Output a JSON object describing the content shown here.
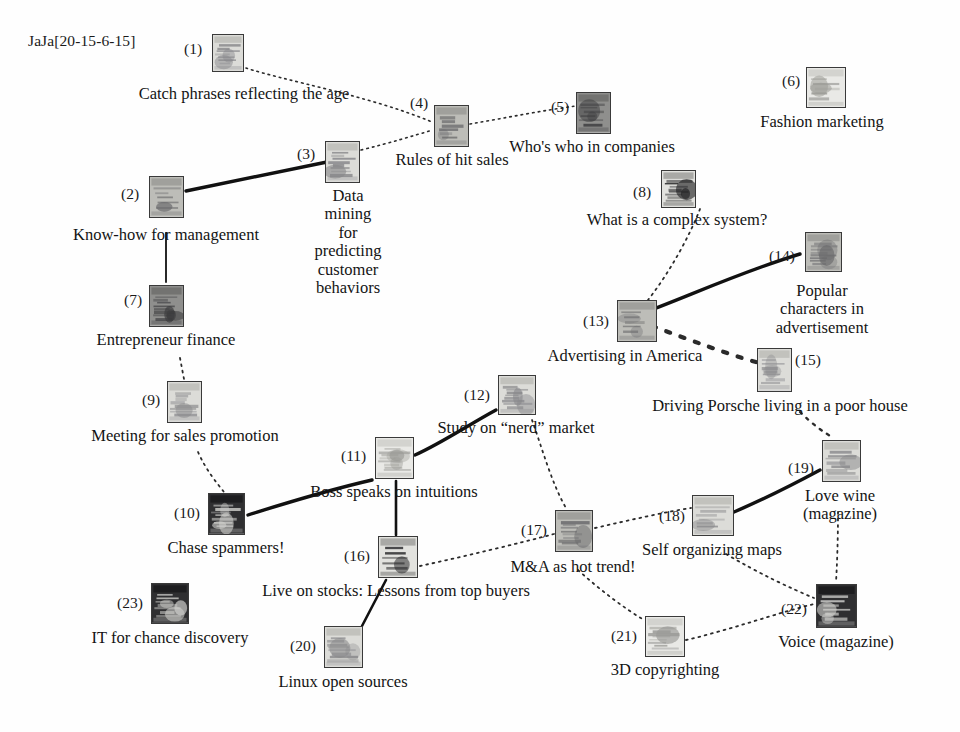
{
  "header": {
    "label": "JaJa[20-15-6-15]"
  },
  "colors": {
    "background": "#fefefe",
    "text": "#141414",
    "edge_solid": "#111111",
    "edge_dashed": "#2b2b2b",
    "thumb_border": "#3a3a3a"
  },
  "nodes": [
    {
      "id": 1,
      "index": "(1)",
      "caption": "Catch phrases reflecting the age",
      "thumb": {
        "x": 212,
        "y": 34,
        "w": 32,
        "h": 38,
        "tone": "light",
        "pattern": "photo-a"
      },
      "index_x": 184,
      "index_y": 41,
      "caption_x": 244,
      "caption_y": 85,
      "caption_w": 0,
      "caption_align": "center"
    },
    {
      "id": 2,
      "index": "(2)",
      "caption": "Know-how for management",
      "thumb": {
        "x": 149,
        "y": 176,
        "w": 35,
        "h": 42,
        "tone": "mid",
        "pattern": "photo-b"
      },
      "index_x": 121,
      "index_y": 186,
      "caption_x": 166,
      "caption_y": 226,
      "caption_w": 0,
      "caption_align": "center"
    },
    {
      "id": 3,
      "index": "(3)",
      "caption": "Data mining for predicting\ncustomer behaviors",
      "thumb": {
        "x": 325,
        "y": 141,
        "w": 35,
        "h": 42,
        "tone": "light",
        "pattern": "photo-c"
      },
      "index_x": 297,
      "index_y": 146,
      "caption_x": 348,
      "caption_y": 187,
      "caption_w": 0,
      "caption_align": "center"
    },
    {
      "id": 4,
      "index": "(4)",
      "caption": "Rules of hit sales",
      "thumb": {
        "x": 434,
        "y": 105,
        "w": 35,
        "h": 42,
        "tone": "mid",
        "pattern": "photo-d"
      },
      "index_x": 410,
      "index_y": 95,
      "caption_x": 452,
      "caption_y": 151,
      "caption_w": 0,
      "caption_align": "center"
    },
    {
      "id": 5,
      "index": "(5)",
      "caption": "Who's who in companies",
      "thumb": {
        "x": 576,
        "y": 92,
        "w": 35,
        "h": 42,
        "tone": "dark",
        "pattern": "photo-e"
      },
      "index_x": 551,
      "index_y": 99,
      "caption_x": 592,
      "caption_y": 138,
      "caption_w": 0,
      "caption_align": "center"
    },
    {
      "id": 6,
      "index": "(6)",
      "caption": "Fashion marketing",
      "thumb": {
        "x": 806,
        "y": 67,
        "w": 40,
        "h": 41,
        "tone": "pale",
        "pattern": "photo-f"
      },
      "index_x": 782,
      "index_y": 73,
      "caption_x": 822,
      "caption_y": 113,
      "caption_w": 0,
      "caption_align": "center"
    },
    {
      "id": 7,
      "index": "(7)",
      "caption": "Entrepreneur finance",
      "thumb": {
        "x": 149,
        "y": 285,
        "w": 35,
        "h": 42,
        "tone": "dark",
        "pattern": "photo-g"
      },
      "index_x": 124,
      "index_y": 292,
      "caption_x": 166,
      "caption_y": 331,
      "caption_w": 0,
      "caption_align": "center"
    },
    {
      "id": 8,
      "index": "(8)",
      "caption": "What is a complex system?",
      "thumb": {
        "x": 661,
        "y": 170,
        "w": 35,
        "h": 38,
        "tone": "contrast",
        "pattern": "photo-h"
      },
      "index_x": 633,
      "index_y": 184,
      "caption_x": 677,
      "caption_y": 211,
      "caption_w": 0,
      "caption_align": "center"
    },
    {
      "id": 9,
      "index": "(9)",
      "caption": "Meeting for sales promotion",
      "thumb": {
        "x": 167,
        "y": 381,
        "w": 35,
        "h": 42,
        "tone": "light",
        "pattern": "photo-i"
      },
      "index_x": 142,
      "index_y": 392,
      "caption_x": 185,
      "caption_y": 427,
      "caption_w": 0,
      "caption_align": "center"
    },
    {
      "id": 10,
      "index": "(10)",
      "caption": "Chase spammers!",
      "thumb": {
        "x": 208,
        "y": 493,
        "w": 37,
        "h": 42,
        "tone": "verydark",
        "pattern": "photo-j"
      },
      "index_x": 174,
      "index_y": 505,
      "caption_x": 226,
      "caption_y": 539,
      "caption_w": 0,
      "caption_align": "center"
    },
    {
      "id": 11,
      "index": "(11)",
      "caption": "Boss speaks on intuitions",
      "thumb": {
        "x": 375,
        "y": 437,
        "w": 39,
        "h": 42,
        "tone": "pale",
        "pattern": "photo-k"
      },
      "index_x": 341,
      "index_y": 448,
      "caption_x": 394,
      "caption_y": 483,
      "caption_w": 0,
      "caption_align": "center"
    },
    {
      "id": 12,
      "index": "(12)",
      "caption": "Study on “nerd” market",
      "thumb": {
        "x": 498,
        "y": 375,
        "w": 38,
        "h": 40,
        "tone": "light",
        "pattern": "photo-l"
      },
      "index_x": 464,
      "index_y": 387,
      "caption_x": 516,
      "caption_y": 419,
      "caption_w": 0,
      "caption_align": "center"
    },
    {
      "id": 13,
      "index": "(13)",
      "caption": "Advertising in America",
      "thumb": {
        "x": 617,
        "y": 300,
        "w": 40,
        "h": 42,
        "tone": "mid",
        "pattern": "photo-m"
      },
      "index_x": 583,
      "index_y": 313,
      "caption_x": 625,
      "caption_y": 347,
      "caption_w": 0,
      "caption_align": "center"
    },
    {
      "id": 14,
      "index": "(14)",
      "caption": "Popular characters in\nadvertisement",
      "thumb": {
        "x": 805,
        "y": 232,
        "w": 37,
        "h": 40,
        "tone": "mid",
        "pattern": "photo-n"
      },
      "index_x": 769,
      "index_y": 248,
      "caption_x": 822,
      "caption_y": 282,
      "caption_w": 0,
      "caption_align": "center"
    },
    {
      "id": 15,
      "index": "(15)",
      "caption": "Driving Porsche living in a poor house",
      "thumb": {
        "x": 757,
        "y": 348,
        "w": 35,
        "h": 44,
        "tone": "light",
        "pattern": "photo-o"
      },
      "index_x": 795,
      "index_y": 352,
      "caption_x": 780,
      "caption_y": 397,
      "caption_w": 0,
      "caption_align": "center"
    },
    {
      "id": 16,
      "index": "(16)",
      "caption": "Live on stocks: Lessons from top buyers",
      "thumb": {
        "x": 378,
        "y": 536,
        "w": 40,
        "h": 42,
        "tone": "contrast",
        "pattern": "photo-p"
      },
      "index_x": 344,
      "index_y": 548,
      "caption_x": 396,
      "caption_y": 582,
      "caption_w": 0,
      "caption_align": "center"
    },
    {
      "id": 17,
      "index": "(17)",
      "caption": "M&A as hot trend!",
      "thumb": {
        "x": 555,
        "y": 510,
        "w": 38,
        "h": 42,
        "tone": "mid",
        "pattern": "photo-q"
      },
      "index_x": 521,
      "index_y": 522,
      "caption_x": 573,
      "caption_y": 558,
      "caption_w": 0,
      "caption_align": "center"
    },
    {
      "id": 18,
      "index": "(18)",
      "caption": "Self organizing maps",
      "thumb": {
        "x": 692,
        "y": 495,
        "w": 42,
        "h": 41,
        "tone": "light",
        "pattern": "photo-r"
      },
      "index_x": 659,
      "index_y": 508,
      "caption_x": 712,
      "caption_y": 541,
      "caption_w": 0,
      "caption_align": "center"
    },
    {
      "id": 19,
      "index": "(19)",
      "caption": "Love wine\n(magazine)",
      "thumb": {
        "x": 822,
        "y": 440,
        "w": 39,
        "h": 42,
        "tone": "light",
        "pattern": "photo-s"
      },
      "index_x": 788,
      "index_y": 460,
      "caption_x": 840,
      "caption_y": 487,
      "caption_w": 0,
      "caption_align": "center"
    },
    {
      "id": 20,
      "index": "(20)",
      "caption": "Linux open sources",
      "thumb": {
        "x": 324,
        "y": 626,
        "w": 39,
        "h": 42,
        "tone": "light",
        "pattern": "photo-t"
      },
      "index_x": 290,
      "index_y": 638,
      "caption_x": 343,
      "caption_y": 673,
      "caption_w": 0,
      "caption_align": "center"
    },
    {
      "id": 21,
      "index": "(21)",
      "caption": "3D copyrighting",
      "thumb": {
        "x": 645,
        "y": 616,
        "w": 40,
        "h": 41,
        "tone": "pale",
        "pattern": "photo-u"
      },
      "index_x": 611,
      "index_y": 628,
      "caption_x": 665,
      "caption_y": 661,
      "caption_w": 0,
      "caption_align": "center"
    },
    {
      "id": 22,
      "index": "(22)",
      "caption": "Voice (magazine)",
      "thumb": {
        "x": 816,
        "y": 584,
        "w": 41,
        "h": 44,
        "tone": "verydark",
        "pattern": "photo-v"
      },
      "index_x": 781,
      "index_y": 601,
      "caption_x": 836,
      "caption_y": 633,
      "caption_w": 0,
      "caption_align": "center"
    },
    {
      "id": 23,
      "index": "(23)",
      "caption": "IT for chance discovery",
      "thumb": {
        "x": 151,
        "y": 583,
        "w": 38,
        "h": 41,
        "tone": "verydark",
        "pattern": "photo-w"
      },
      "index_x": 117,
      "index_y": 595,
      "caption_x": 170,
      "caption_y": 629,
      "caption_w": 0,
      "caption_align": "center"
    }
  ],
  "edges": [
    {
      "from": 1,
      "to": 4,
      "style": "dotted",
      "weight": 1.6,
      "path": "M 246 68 C 282 80, 370 96, 432 122"
    },
    {
      "from": 4,
      "to": 5,
      "style": "dotted",
      "weight": 1.6,
      "path": "M 470 124 C 505 118, 545 110, 576 106"
    },
    {
      "from": 3,
      "to": 4,
      "style": "dotted",
      "weight": 1.6,
      "path": "M 361 150 C 390 143, 412 136, 433 130"
    },
    {
      "from": 2,
      "to": 3,
      "style": "solid",
      "weight": 3.4,
      "path": "M 186 191 L 327 162"
    },
    {
      "from": 2,
      "to": 7,
      "style": "solid",
      "weight": 1.8,
      "path": "M 166 233 L 166 282"
    },
    {
      "from": 7,
      "to": 9,
      "style": "dotted",
      "weight": 1.8,
      "path": "M 180 358 L 184 379"
    },
    {
      "from": 9,
      "to": 10,
      "style": "dotted",
      "weight": 1.8,
      "path": "M 198 452 C 206 470, 216 482, 224 492"
    },
    {
      "from": 10,
      "to": 11,
      "style": "solid",
      "weight": 3.4,
      "path": "M 248 515 C 280 505, 320 492, 372 480"
    },
    {
      "from": 11,
      "to": 12,
      "style": "solid",
      "weight": 3.4,
      "path": "M 415 455 C 440 444, 470 424, 496 410"
    },
    {
      "from": 11,
      "to": 16,
      "style": "solid",
      "weight": 2.6,
      "path": "M 396 481 L 396 535"
    },
    {
      "from": 12,
      "to": 17,
      "style": "dotted",
      "weight": 1.8,
      "path": "M 532 420 C 542 448, 552 484, 566 508"
    },
    {
      "from": 16,
      "to": 17,
      "style": "dotted",
      "weight": 1.8,
      "path": "M 420 566 C 466 556, 516 544, 554 534"
    },
    {
      "from": 16,
      "to": 20,
      "style": "solid",
      "weight": 2.6,
      "path": "M 386 580 L 362 626"
    },
    {
      "from": 17,
      "to": 18,
      "style": "dotted",
      "weight": 1.8,
      "path": "M 595 528 C 630 520, 665 512, 691 508"
    },
    {
      "from": 18,
      "to": 19,
      "style": "solid",
      "weight": 3.4,
      "path": "M 734 512 C 762 500, 794 484, 820 470"
    },
    {
      "from": 18,
      "to": 22,
      "style": "dotted",
      "weight": 1.8,
      "path": "M 726 554 C 760 574, 790 588, 814 598"
    },
    {
      "from": 17,
      "to": 21,
      "style": "dotted",
      "weight": 1.8,
      "path": "M 578 570 C 600 590, 624 608, 644 620"
    },
    {
      "from": 21,
      "to": 22,
      "style": "dotted",
      "weight": 1.8,
      "path": "M 686 640 C 730 630, 780 612, 814 604"
    },
    {
      "from": 19,
      "to": 22,
      "style": "dotted",
      "weight": 1.8,
      "path": "M 838 512 C 838 540, 837 566, 836 582"
    },
    {
      "from": 15,
      "to": 19,
      "style": "dotted",
      "weight": 2.4,
      "path": "M 800 412 C 812 424, 826 434, 834 438"
    },
    {
      "from": 13,
      "to": 15,
      "style": "dotted",
      "weight": 4.2,
      "path": "M 652 326 C 690 340, 730 355, 756 362"
    },
    {
      "from": 13,
      "to": 14,
      "style": "solid",
      "weight": 3.4,
      "path": "M 640 314 C 680 300, 740 272, 800 254"
    },
    {
      "from": 8,
      "to": 13,
      "style": "dotted",
      "weight": 1.8,
      "path": "M 700 209 C 690 235, 670 272, 648 300"
    }
  ]
}
